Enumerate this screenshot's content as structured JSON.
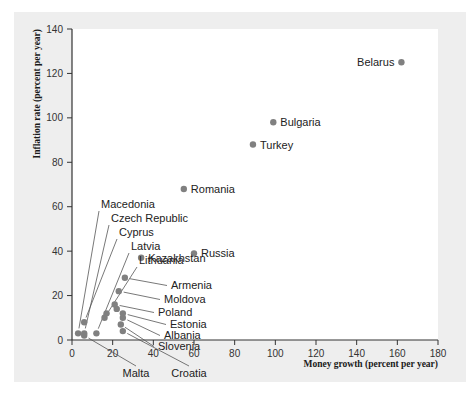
{
  "figure": {
    "background_color": "#eeeeee",
    "plot_background_color": "#ffffff",
    "dot_color": "#808080",
    "axis_color": "#333333"
  },
  "chart_data": {
    "type": "scatter",
    "title": "",
    "xlabel": "Money growth (percent per year)",
    "ylabel": "Inflation rate (percent per year)",
    "xlim": [
      0,
      180
    ],
    "ylim": [
      0,
      140
    ],
    "xticks": [
      0,
      20,
      40,
      60,
      80,
      100,
      120,
      140,
      160,
      180
    ],
    "yticks": [
      0,
      20,
      40,
      60,
      80,
      100,
      120,
      140
    ],
    "grid": false,
    "legend": "none",
    "points": [
      {
        "label": "Belarus",
        "x": 162,
        "y": 125,
        "label_side": "left",
        "leader": false
      },
      {
        "label": "Bulgaria",
        "x": 99,
        "y": 98,
        "label_side": "right",
        "leader": false
      },
      {
        "label": "Turkey",
        "x": 89,
        "y": 88,
        "label_side": "right",
        "leader": false
      },
      {
        "label": "Romania",
        "x": 55,
        "y": 68,
        "label_side": "right",
        "leader": false
      },
      {
        "label": "Russia",
        "x": 60,
        "y": 39,
        "label_side": "right",
        "leader": false
      },
      {
        "label": "Kazakhstan",
        "x": 34,
        "y": 37,
        "label_side": "right",
        "leader": false
      },
      {
        "label": "Armenia",
        "x": 26,
        "y": 28,
        "label_side": "right",
        "leader": true
      },
      {
        "label": "Moldova",
        "x": 23,
        "y": 22,
        "label_side": "right",
        "leader": true
      },
      {
        "label": "Poland",
        "x": 21,
        "y": 16,
        "label_side": "right",
        "leader": true
      },
      {
        "label": "Estonia",
        "x": 25,
        "y": 12,
        "label_side": "right",
        "leader": true
      },
      {
        "label": "Albania",
        "x": 25,
        "y": 10,
        "label_side": "right",
        "leader": true
      },
      {
        "label": "Slovenia",
        "x": 24,
        "y": 7,
        "label_side": "right",
        "leader": true
      },
      {
        "label": "Macedonia",
        "x": 3,
        "y": 3,
        "label_side": "upleft",
        "leader": true
      },
      {
        "label": "Czech Republic",
        "x": 6,
        "y": 3,
        "label_side": "upleft",
        "leader": true
      },
      {
        "label": "Cyprus",
        "x": 6,
        "y": 8,
        "label_side": "upleft",
        "leader": true
      },
      {
        "label": "Latvia",
        "x": 12,
        "y": 3,
        "label_side": "upleft",
        "leader": true
      },
      {
        "label": "Lithuania",
        "x": 16,
        "y": 10,
        "label_side": "upleft",
        "leader": true
      },
      {
        "label": "Malta",
        "x": 6,
        "y": 2,
        "label_side": "below",
        "leader": true
      },
      {
        "label": "Croatia",
        "x": 25,
        "y": 4,
        "label_side": "below",
        "leader": true
      },
      {
        "label": "",
        "x": 17,
        "y": 12,
        "label_side": "none",
        "leader": false
      },
      {
        "label": "",
        "x": 22,
        "y": 14,
        "label_side": "none",
        "leader": false
      }
    ]
  }
}
